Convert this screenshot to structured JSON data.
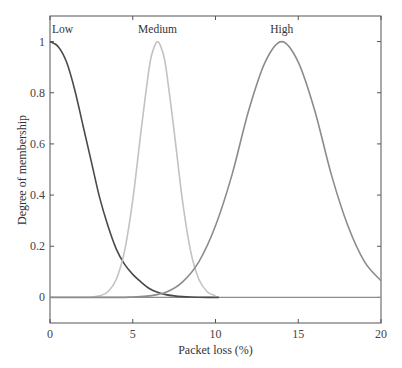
{
  "chart_data": {
    "type": "line",
    "title": "",
    "xlabel": "Packet loss (%)",
    "ylabel": "Degree of membership",
    "xlim": [
      0,
      20
    ],
    "ylim": [
      -0.1,
      1.1
    ],
    "xticks": [
      0,
      5,
      10,
      15,
      20
    ],
    "xtick_labels": [
      "0",
      "5",
      "10",
      "15",
      "20"
    ],
    "yticks": [
      0,
      0.2,
      0.4,
      0.6,
      0.8,
      1
    ],
    "ytick_labels": [
      "0",
      "0.2",
      "0.4",
      "0.6",
      "0.8",
      "1"
    ],
    "grid": false,
    "legend": "none (curves labeled inline)",
    "series": [
      {
        "name": "Low",
        "color": "#4a4a4a",
        "label_pos": [
          0.4,
          1.04
        ],
        "x": [
          0,
          0.5,
          1,
          1.5,
          2,
          2.5,
          3,
          3.5,
          4,
          4.5,
          5,
          5.5,
          6,
          6.5,
          7,
          7.5,
          8,
          8.5,
          9,
          9.5,
          10,
          10.2
        ],
        "values": [
          1.0,
          0.98,
          0.92,
          0.81,
          0.67,
          0.53,
          0.39,
          0.28,
          0.19,
          0.13,
          0.09,
          0.06,
          0.035,
          0.02,
          0.011,
          0.006,
          0.003,
          0.0015,
          0.0008,
          0.0003,
          0.0001,
          0.0
        ]
      },
      {
        "name": "Medium",
        "color": "#c2c2c2",
        "label_pos": [
          6.5,
          1.04
        ],
        "x": [
          2.5,
          3,
          3.5,
          4,
          4.5,
          5,
          5.5,
          6,
          6.25,
          6.5,
          6.75,
          7,
          7.5,
          8,
          8.5,
          9,
          9.5,
          10
        ],
        "values": [
          0.0011,
          0.006,
          0.022,
          0.07,
          0.18,
          0.38,
          0.65,
          0.9,
          0.97,
          1.0,
          0.97,
          0.9,
          0.65,
          0.38,
          0.18,
          0.07,
          0.022,
          0.006
        ]
      },
      {
        "name": "High",
        "color": "#8c8c8c",
        "label_pos": [
          14.0,
          1.04
        ],
        "x": [
          0,
          4,
          5,
          6,
          7,
          8,
          9,
          10,
          11,
          12,
          13,
          14,
          15,
          16,
          17,
          18,
          19,
          20
        ],
        "values": [
          0.0,
          0.0002,
          0.0018,
          0.006,
          0.02,
          0.06,
          0.14,
          0.28,
          0.48,
          0.73,
          0.92,
          1.0,
          0.92,
          0.73,
          0.48,
          0.28,
          0.14,
          0.065
        ]
      }
    ]
  }
}
